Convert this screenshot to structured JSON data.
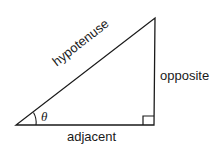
{
  "diagram": {
    "type": "right-triangle",
    "labels": {
      "hypotenuse": "hypotenuse",
      "opposite": "opposite",
      "adjacent": "adjacent",
      "angle": "θ"
    },
    "colors": {
      "stroke": "#1a1a1a",
      "background": "#ffffff"
    }
  }
}
